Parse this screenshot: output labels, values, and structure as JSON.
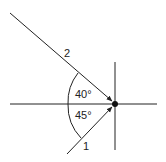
{
  "diagram": {
    "type": "ray-angle-diagram",
    "colors": {
      "line": "#222222",
      "background": "#ffffff"
    },
    "rays": [
      {
        "id": "2",
        "label": "2",
        "direction": "incoming from upper-left"
      },
      {
        "id": "1",
        "label": "1",
        "direction": "incoming from lower-left"
      }
    ],
    "angles": [
      {
        "label": "40°",
        "between": [
          "ray-2",
          "horizontal-axis"
        ]
      },
      {
        "label": "45°",
        "between": [
          "horizontal-axis",
          "ray-1"
        ]
      }
    ],
    "axes": [
      "horizontal-axis",
      "vertical-axis"
    ],
    "point": "intersection-point"
  }
}
